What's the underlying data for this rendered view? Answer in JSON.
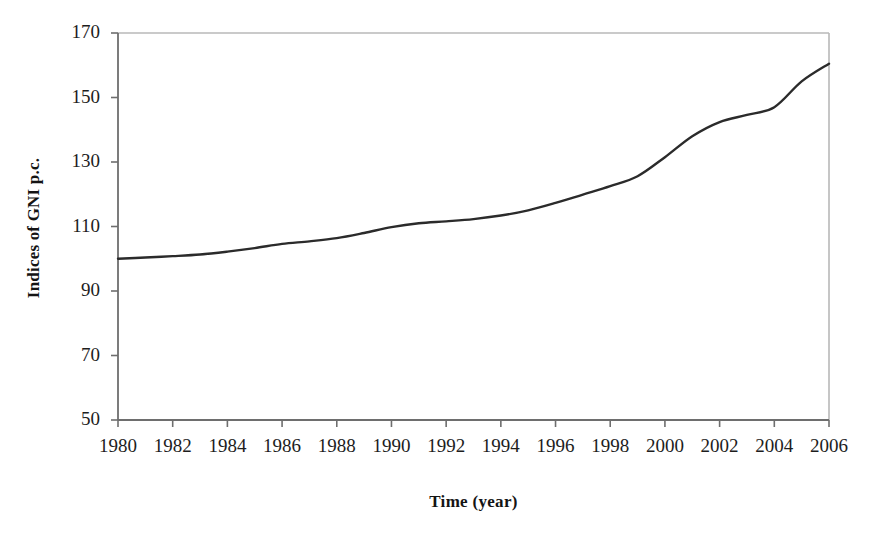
{
  "chart_data": {
    "type": "line",
    "title": "",
    "xlabel": "Time (year)",
    "ylabel": "Indices of GNI p.c.",
    "xlim": [
      1980,
      2006
    ],
    "ylim": [
      50,
      170
    ],
    "grid": false,
    "legend": null,
    "x_ticks": [
      "1980",
      "1982",
      "1984",
      "1986",
      "1988",
      "1990",
      "1992",
      "1994",
      "1996",
      "1998",
      "2000",
      "2002",
      "2004",
      "2006"
    ],
    "y_ticks": [
      "50",
      "70",
      "90",
      "110",
      "130",
      "150",
      "170"
    ],
    "series": [
      {
        "name": "Indices of GNI p.c.",
        "color": "#2b2b2b",
        "x": [
          1980,
          1981,
          1982,
          1983,
          1984,
          1985,
          1986,
          1987,
          1988,
          1989,
          1990,
          1991,
          1992,
          1993,
          1994,
          1995,
          1996,
          1997,
          1998,
          1999,
          2000,
          2001,
          2002,
          2003,
          2004,
          2005,
          2006
        ],
        "values": [
          100.0,
          100.4,
          100.8,
          101.3,
          102.2,
          103.3,
          104.6,
          105.4,
          106.4,
          108.0,
          109.8,
          111.0,
          111.6,
          112.3,
          113.4,
          115.0,
          117.3,
          119.9,
          122.5,
          125.6,
          131.5,
          138.0,
          142.4,
          144.6,
          147.0,
          155.0,
          160.5
        ]
      }
    ]
  },
  "axes": {
    "y_title": "Indices of GNI p.c.",
    "x_title": "Time (year)"
  },
  "ghost_text": {
    "top_fragment": ""
  },
  "colors": {
    "line": "#2b2b2b",
    "axis": "#7a7a7a",
    "frame": "#b3b3b3",
    "text": "#1a1a1a",
    "background": "#ffffff"
  }
}
